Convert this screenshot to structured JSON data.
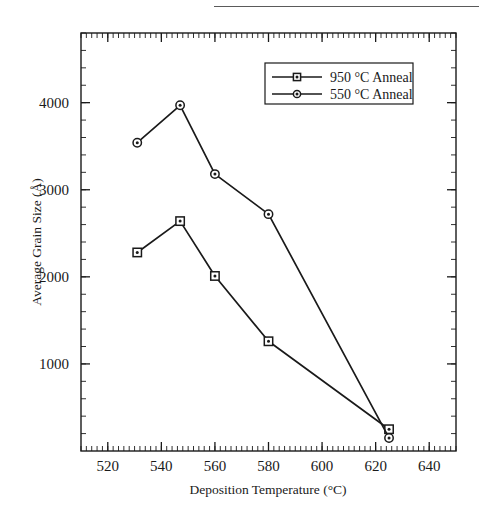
{
  "figure": {
    "background_color": "#ffffff",
    "ink_color": "#1a1a1a"
  },
  "chart_data": {
    "type": "line",
    "title": "",
    "xlabel": "Deposition Temperature (°C)",
    "ylabel": "Average Grain Size (Å)",
    "xlim": [
      510,
      650
    ],
    "ylim": [
      0,
      4800
    ],
    "xticks": [
      520,
      540,
      560,
      580,
      600,
      620,
      640
    ],
    "xtick_labels": [
      "520",
      "540",
      "560",
      "580",
      "600",
      "620",
      "640"
    ],
    "yticks": [
      1000,
      2000,
      3000,
      4000
    ],
    "ytick_labels": [
      "1000",
      "2000",
      "3000",
      "4000"
    ],
    "x_minor_tick_step": 2,
    "y_minor_tick_step": 200,
    "grid": false,
    "legend_position": "upper right",
    "series": [
      {
        "name": "950 °C Anneal",
        "marker": "square",
        "color": "#1a1a1a",
        "x": [
          531,
          547,
          560,
          580,
          625
        ],
        "values": [
          2280,
          2640,
          2010,
          1260,
          250
        ]
      },
      {
        "name": "550 °C Anneal",
        "marker": "circle",
        "color": "#1a1a1a",
        "x": [
          531,
          547,
          560,
          580,
          625
        ],
        "values": [
          3540,
          3970,
          3180,
          2720,
          150
        ]
      }
    ]
  },
  "legend": {
    "entries": [
      {
        "label": "950 °C Anneal",
        "marker": "square"
      },
      {
        "label": "550 °C Anneal",
        "marker": "circle"
      }
    ]
  }
}
